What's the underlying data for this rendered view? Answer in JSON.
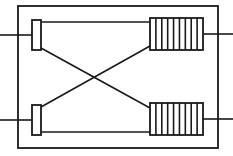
{
  "canvas": {
    "width": 233,
    "height": 156,
    "background": "#ffffff",
    "title": "Crossed-connection two-winding circuit schematic"
  },
  "style": {
    "stroke": "#1a1a1a",
    "frame_stroke_width": 1.8,
    "wire_stroke_width": 1.6,
    "component_stroke_width": 1.8,
    "coil_hatch_stroke_width": 1.6,
    "fill": "#ffffff"
  },
  "diagram": {
    "type": "electrical-schematic",
    "frame": {
      "name": "outer-frame",
      "x": 18,
      "y": 6,
      "width": 200,
      "height": 142
    },
    "components": [
      {
        "id": "contact-upper-left",
        "kind": "vertical-bar-element",
        "label": "upper-left-bar",
        "x": 32,
        "y": 20,
        "width": 9,
        "height": 30
      },
      {
        "id": "contact-lower-left",
        "kind": "vertical-bar-element",
        "label": "lower-left-bar",
        "x": 32,
        "y": 105,
        "width": 9,
        "height": 30
      },
      {
        "id": "coil-upper-right",
        "kind": "winding-element",
        "label": "upper-right-coil",
        "x": 150,
        "y": 18,
        "width": 53,
        "height": 32,
        "hatch_count": 8
      },
      {
        "id": "coil-lower-right",
        "kind": "winding-element",
        "label": "lower-right-coil",
        "x": 150,
        "y": 103,
        "width": 53,
        "height": 32,
        "hatch_count": 8
      }
    ],
    "terminals": [
      {
        "id": "terminal-top-left",
        "side": "left",
        "x1": 0,
        "y1": 35,
        "x2": 32,
        "y2": 35
      },
      {
        "id": "terminal-bottom-left",
        "side": "left",
        "x1": 0,
        "y1": 120,
        "x2": 32,
        "y2": 120
      },
      {
        "id": "terminal-top-right",
        "side": "right",
        "x1": 203,
        "y1": 34,
        "x2": 233,
        "y2": 34
      },
      {
        "id": "terminal-bottom-right",
        "side": "right",
        "x1": 203,
        "y1": 119,
        "x2": 233,
        "y2": 119
      }
    ],
    "wires": [
      {
        "id": "wire-top-straight",
        "kind": "horizontal",
        "x1": 41,
        "y1": 22,
        "x2": 150,
        "y2": 22
      },
      {
        "id": "wire-bottom-straight",
        "kind": "horizontal",
        "x1": 41,
        "y1": 132,
        "x2": 150,
        "y2": 132
      },
      {
        "id": "wire-diagonal-down",
        "kind": "diagonal",
        "x1": 41,
        "y1": 48,
        "x2": 150,
        "y2": 108
      },
      {
        "id": "wire-diagonal-up",
        "kind": "diagonal",
        "x1": 41,
        "y1": 107,
        "x2": 150,
        "y2": 46
      }
    ],
    "crossing_point": {
      "x": 96,
      "y": 78
    }
  }
}
